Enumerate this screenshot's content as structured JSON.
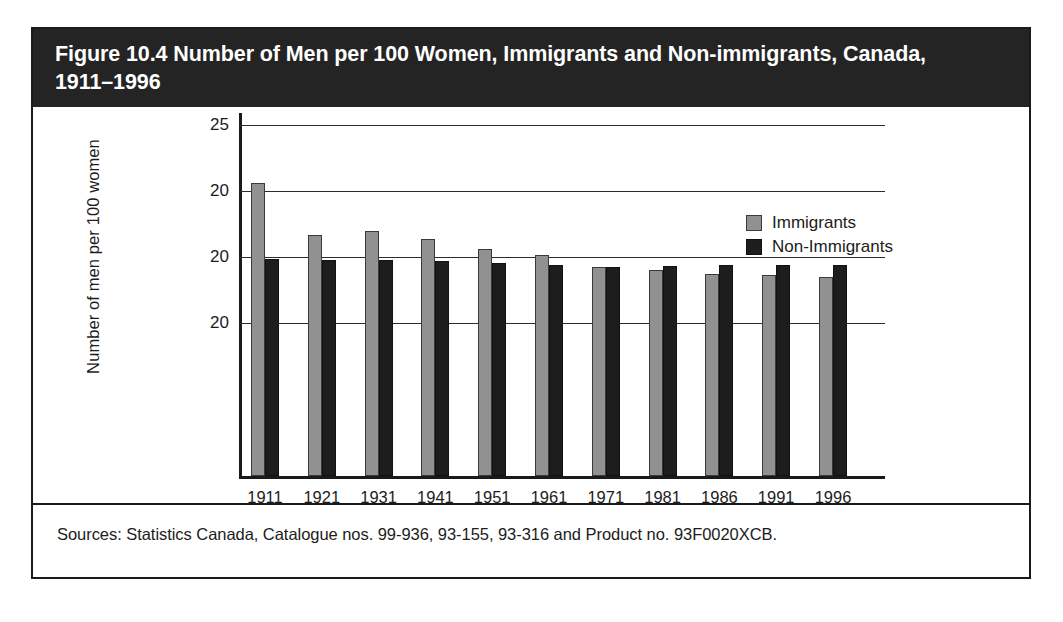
{
  "figure": {
    "title": "Figure 10.4 Number of Men per 100 Women, Immigrants and Non-immigrants, Canada,\n1911–1996",
    "source_note": "Sources: Statistics Canada, Catalogue nos. 99-936, 93-155, 93-316 and Product no. 93F0020XCB."
  },
  "legend": {
    "position": "top-right",
    "entries": [
      {
        "label": "Immigrants",
        "color": "#919191"
      },
      {
        "label": "Non-Immigrants",
        "color": "#1d1d1d"
      }
    ]
  },
  "colors": {
    "title_bar": "#242424",
    "immigrants": "#919191",
    "non_immigrants": "#1d1d1d",
    "axis": "#1a1a1a",
    "frame": "#1a1a1a"
  },
  "chart_data": {
    "type": "bar",
    "title": "Figure 10.4 Number of Men per 100 Women, Immigrants and Non-immigrants, Canada, 1911–1996",
    "xlabel": "",
    "ylabel": "Number of men per 100 women",
    "categories": [
      "1911",
      "1921",
      "1931",
      "1941",
      "1951",
      "1961",
      "1971",
      "1981",
      "1986",
      "1991",
      "1996"
    ],
    "series": [
      {
        "name": "Immigrants",
        "color": "#919191",
        "values": [
          122.5,
          113.0,
          113.6,
          112.4,
          111.0,
          110.2,
          108.5,
          108.1,
          107.7,
          107.5,
          107.2
        ]
      },
      {
        "name": "Non-Immigrants",
        "color": "#1d1d1d",
        "values": [
          108.6,
          108.5,
          108.5,
          108.4,
          108.2,
          108.1,
          108.0,
          108.1,
          108.2,
          108.2,
          108.2
        ]
      }
    ],
    "y_tick_labels": [
      "25",
      "20",
      "20",
      "20"
    ],
    "y_tick_values": [
      125,
      120,
      115,
      110
    ],
    "ylim": [
      100,
      126.5
    ],
    "grid": true,
    "legend_position": "top-right",
    "bar_pixel_tops": {
      "note": "top offsets in px from the 25 gridline, plot height 354px baseline at bottom",
      "immigrants": [
        58,
        110,
        106,
        114,
        124,
        130,
        142,
        145,
        149,
        150,
        152
      ],
      "non_immigrants": [
        134,
        135,
        135,
        136,
        138,
        140,
        142,
        141,
        140,
        140,
        140
      ]
    }
  }
}
